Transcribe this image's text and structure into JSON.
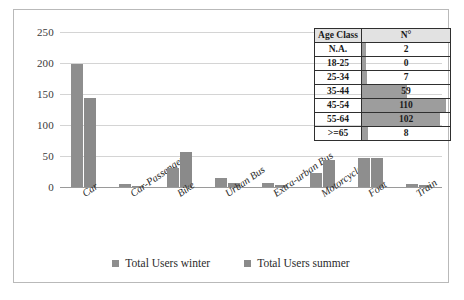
{
  "chart_data": {
    "type": "bar",
    "title": "",
    "xlabel": "",
    "ylabel": "",
    "ylim": [
      0,
      250
    ],
    "yticks": [
      0,
      50,
      100,
      150,
      200,
      250
    ],
    "grid": true,
    "legend_position": "bottom",
    "categories": [
      "Car",
      "Car-Passenger",
      "Bike",
      "Urban Bus",
      "Extra-urban Bus",
      "Motorcycle",
      "Foot",
      "Train"
    ],
    "series": [
      {
        "name": "Total Users winter",
        "color": "#8e8e8e",
        "values": [
          198,
          5,
          31,
          14,
          6,
          22,
          46,
          5
        ]
      },
      {
        "name": "Total Users summer",
        "color": "#8a8a8a",
        "values": [
          143,
          2,
          56,
          7,
          3,
          44,
          47,
          4
        ]
      }
    ]
  },
  "table": {
    "headers": [
      "Age Class",
      "N°"
    ],
    "max": 110,
    "rows": [
      {
        "age_class": "N.A.",
        "n": 2
      },
      {
        "age_class": "18-25",
        "n": 0
      },
      {
        "age_class": "25-34",
        "n": 7
      },
      {
        "age_class": "35-44",
        "n": 59
      },
      {
        "age_class": "45-54",
        "n": 110
      },
      {
        "age_class": "55-64",
        "n": 102
      },
      {
        "age_class": ">=65",
        "n": 8
      }
    ]
  }
}
